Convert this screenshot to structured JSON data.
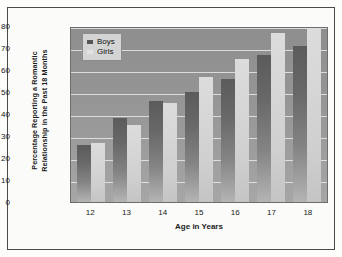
{
  "chart_data": {
    "type": "bar",
    "title": "",
    "xlabel": "Age in Years",
    "ylabel": "Percentage Reporting a Romantic Relationship in the Past 18 Months",
    "ylabel_line1": "Percentage Reporting a Romantic",
    "ylabel_line2": "Relationship in the Past 18 Months",
    "categories": [
      "12",
      "13",
      "14",
      "15",
      "16",
      "17",
      "18"
    ],
    "series": [
      {
        "name": "Boys",
        "values": [
          26,
          38,
          46,
          50,
          56,
          67,
          71
        ],
        "color": "#5b5b5b"
      },
      {
        "name": "Girls",
        "values": [
          27,
          35,
          45,
          57,
          65,
          77,
          79
        ],
        "color": "#dcdcdc"
      }
    ],
    "ylim": [
      0,
      80
    ],
    "yticks": [
      "80",
      "70",
      "60",
      "50",
      "40",
      "30",
      "20",
      "10",
      "0"
    ],
    "ytick_values": [
      80,
      70,
      60,
      50,
      40,
      30,
      20,
      10,
      0
    ],
    "grid": true,
    "gridlines": "horizontal",
    "legend_position": "top-left-inside",
    "legend": [
      "Boys",
      "Girls"
    ],
    "plot_background_color": "#949494",
    "gridline_color": "#e9e9e9",
    "frame_color": "#4a4a4a"
  }
}
